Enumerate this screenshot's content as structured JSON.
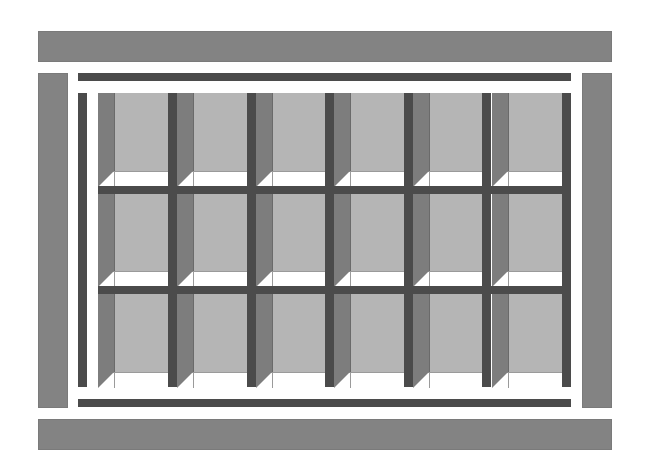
{
  "diagram": {
    "type": "shelving-unit-cubby-grid",
    "rows": 3,
    "columns": 6,
    "parts": {
      "top_board": "top-board",
      "bottom_board": "bottom-board",
      "left_panel": "left-side-panel",
      "right_panel": "right-side-panel",
      "top_rail": "top-rail",
      "bottom_rail": "bottom-rail",
      "left_post": "left-post",
      "cubbies": 18
    },
    "colors": {
      "board": "#838383",
      "rail": "#4b4b4b",
      "cubby_side": "#7d7d7d",
      "cubby_back": "#b5b5b5",
      "cubby_floor": "#ffffff"
    }
  }
}
